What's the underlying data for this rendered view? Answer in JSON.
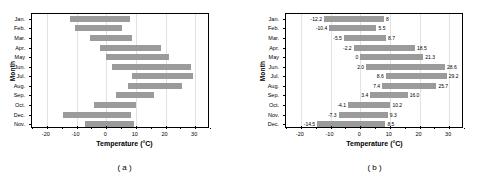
{
  "figure": {
    "panels": [
      {
        "caption": "( a )",
        "xlabel": "Temperature (°C)",
        "ylabel": "Month",
        "show_value_labels": false
      },
      {
        "caption": "( b )",
        "xlabel": "Temperature (°C)",
        "ylabel": "Month",
        "show_value_labels": true
      }
    ],
    "bar_color": "#9b9b9b",
    "grid_color": "#e2e2e2",
    "axis_color": "#000000"
  },
  "chart_data": [
    {
      "type": "bar",
      "orientation": "horizontal",
      "subtype": "floating-range-bar",
      "title": "",
      "caption": "( a )",
      "xlabel": "Temperature (°C)",
      "ylabel": "Month",
      "xlim": [
        -25,
        35
      ],
      "xticks": [
        -20,
        -10,
        0,
        10,
        20,
        30
      ],
      "xticklabels": [
        "-20",
        "-10",
        "0",
        "10",
        "20",
        "30"
      ],
      "grid": true,
      "legend": "none",
      "categories": [
        "Jan.",
        "Feb.",
        "Mar.",
        "Apr.",
        "May",
        "Jun.",
        "Jul.",
        "Aug.",
        "Sep.",
        "Oct.",
        "Dec.",
        "Nov."
      ],
      "series": [
        {
          "name": "min",
          "values": [
            -12.2,
            -10.4,
            -5.5,
            -2.2,
            0.0,
            2.0,
            8.6,
            7.4,
            3.4,
            -4.1,
            -14.5,
            -7.3
          ]
        },
        {
          "name": "max",
          "values": [
            8.0,
            5.5,
            8.7,
            18.5,
            21.3,
            28.6,
            29.2,
            25.7,
            16.0,
            10.2,
            8.5,
            9.3
          ]
        }
      ]
    },
    {
      "type": "bar",
      "orientation": "horizontal",
      "subtype": "floating-range-bar",
      "title": "",
      "caption": "( b )",
      "xlabel": "Temperature (°C)",
      "ylabel": "Month",
      "xlim": [
        -25,
        35
      ],
      "xticks": [
        -20,
        -10,
        0,
        10,
        20,
        30
      ],
      "xticklabels": [
        "-20",
        "-10",
        "0",
        "10",
        "20",
        "30"
      ],
      "grid": true,
      "legend": "none",
      "categories": [
        "Jan.",
        "Feb.",
        "Mar.",
        "Apr.",
        "May",
        "Jun.",
        "Jul.",
        "Aug.",
        "Sep.",
        "Oct.",
        "Nov.",
        "Dec."
      ],
      "series": [
        {
          "name": "min",
          "values": [
            -12.2,
            -10.4,
            -5.5,
            -2.2,
            0.0,
            2.0,
            8.6,
            7.4,
            3.4,
            -4.1,
            -7.3,
            -14.5
          ]
        },
        {
          "name": "max",
          "values": [
            8.0,
            5.5,
            8.7,
            18.5,
            21.3,
            28.6,
            29.2,
            25.7,
            16.0,
            10.2,
            9.3,
            8.5
          ]
        }
      ],
      "min_labels": [
        "-12.2",
        "-10.4",
        "-5.5",
        "-2.2",
        "0",
        "2.0",
        "8.6",
        "7.4",
        "3.4",
        "-4.1",
        "-7.3",
        "-14.5"
      ],
      "max_labels": [
        "8",
        "5.5",
        "8.7",
        "18.5",
        "21.3",
        "28.6",
        "29.2",
        "25.7",
        "16.0",
        "10.2",
        "9.3",
        "8.5"
      ]
    }
  ]
}
